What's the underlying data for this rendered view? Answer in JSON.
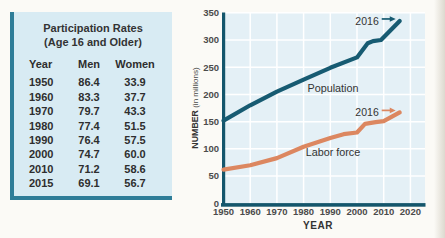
{
  "table": {
    "title_line1": "Participation Rates",
    "title_line2": "(Age 16 and Older)",
    "columns": [
      "Year",
      "Men",
      "Women"
    ],
    "rows": [
      {
        "year": "1950",
        "men": "86.4",
        "women": "33.9"
      },
      {
        "year": "1960",
        "men": "83.3",
        "women": "37.7"
      },
      {
        "year": "1970",
        "men": "79.7",
        "women": "43.3"
      },
      {
        "year": "1980",
        "men": "77.4",
        "women": "51.5"
      },
      {
        "year": "1990",
        "men": "76.4",
        "women": "57.5"
      },
      {
        "year": "2000",
        "men": "74.7",
        "women": "60.0"
      },
      {
        "year": "2010",
        "men": "71.2",
        "women": "58.6"
      },
      {
        "year": "2015",
        "men": "69.1",
        "women": "56.7"
      }
    ]
  },
  "chart_data": {
    "type": "line",
    "title": "",
    "xlabel": "YEAR",
    "ylabel": "NUMBER (in millions)",
    "ylabel_bold": "NUMBER",
    "ylabel_rest": "(in millions)",
    "xlim": [
      1950,
      2025
    ],
    "ylim": [
      0,
      350
    ],
    "x_ticks": [
      1950,
      1960,
      1970,
      1980,
      1990,
      2000,
      2010,
      2020
    ],
    "y_ticks": [
      0,
      50,
      100,
      150,
      200,
      250,
      300,
      350
    ],
    "grid": true,
    "legend_position": "inline-labels",
    "colors": {
      "plot_bg": "#e4f0f6",
      "grid": "#ffffff",
      "axis": "#14566c"
    },
    "series": [
      {
        "name": "Population",
        "color": "#175b72",
        "annotation": "2016",
        "label_pos": {
          "year": 1991,
          "value": 205
        },
        "points": [
          [
            1950,
            152
          ],
          [
            1960,
            180
          ],
          [
            1970,
            205
          ],
          [
            1980,
            227
          ],
          [
            1990,
            249
          ],
          [
            2000,
            268
          ],
          [
            2004,
            294
          ],
          [
            2006,
            298
          ],
          [
            2009,
            300
          ],
          [
            2016,
            335
          ]
        ]
      },
      {
        "name": "Labor force",
        "color": "#dc8760",
        "annotation": "2016",
        "label_pos": {
          "year": 1991,
          "value": 86
        },
        "points": [
          [
            1950,
            62
          ],
          [
            1960,
            70
          ],
          [
            1970,
            83
          ],
          [
            1980,
            104
          ],
          [
            1990,
            120
          ],
          [
            1995,
            127
          ],
          [
            2000,
            130
          ],
          [
            2003,
            146
          ],
          [
            2007,
            149
          ],
          [
            2010,
            151
          ],
          [
            2016,
            167
          ]
        ]
      }
    ]
  }
}
